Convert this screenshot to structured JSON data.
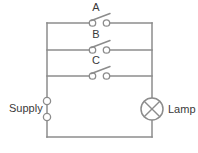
{
  "diagram": {
    "type": "electrical-circuit-schematic",
    "title": "",
    "stroke_color": "#8c8c8c",
    "text_color": "#3a3a3a",
    "background_color": "#ffffff",
    "canvas": {
      "width": 198,
      "height": 153
    },
    "labels": {
      "supply": "Supply",
      "lamp": "Lamp"
    },
    "switches": [
      {
        "id": "A",
        "label": "A",
        "state": "open",
        "branch_y": 23,
        "label_x": 96,
        "label_y": 12
      },
      {
        "id": "B",
        "label": "B",
        "state": "open",
        "branch_y": 50,
        "label_x": 96,
        "label_y": 39
      },
      {
        "id": "C",
        "label": "C",
        "state": "open",
        "branch_y": 76,
        "label_x": 96,
        "label_y": 65
      }
    ],
    "components": [
      {
        "name": "supply-terminal-top",
        "type": "open-terminal",
        "x": 47,
        "y": 101
      },
      {
        "name": "supply-terminal-bottom",
        "type": "open-terminal",
        "x": 47,
        "y": 117
      },
      {
        "name": "lamp",
        "type": "lamp-crossed-circle",
        "x": 152,
        "y": 109,
        "radius": 11
      }
    ],
    "rails": {
      "left_x": 47,
      "right_x": 152,
      "bottom_y": 137
    }
  }
}
